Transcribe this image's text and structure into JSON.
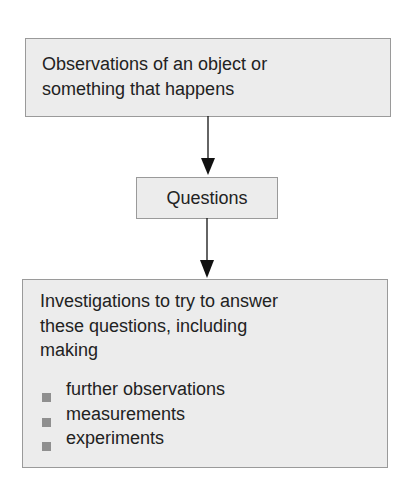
{
  "boxes": {
    "observations": {
      "line1": "Observations of an object or",
      "line2": "something that happens"
    },
    "questions": {
      "label": "Questions"
    },
    "investigations": {
      "line1": "Investigations to try to answer",
      "line2": "these questions, including",
      "line3": "making",
      "bullets": [
        "further observations",
        "measurements",
        "experiments"
      ]
    }
  },
  "colors": {
    "box_fill": "#ececec",
    "box_border": "#9a9a9a",
    "bullet": "#8f8f8f",
    "arrow": "#111111"
  }
}
